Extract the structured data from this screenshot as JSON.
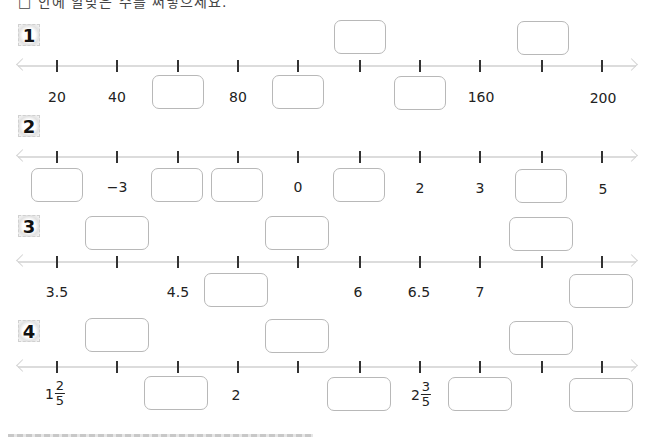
{
  "instruction": "□ 안에 알맞은 수를 써넣으세요.",
  "problems": [
    {
      "number": "1",
      "ticks": [
        "20",
        "40",
        "",
        "80",
        "",
        "",
        "",
        "160",
        "",
        "200"
      ],
      "answer_boxes_above": [
        6,
        9
      ],
      "answer_boxes_below": [
        3,
        5,
        7
      ],
      "labels_below": {
        "1": "20",
        "2": "40",
        "4": "80",
        "8": "160",
        "10": "200"
      }
    },
    {
      "number": "2",
      "ticks": [
        "",
        "-3",
        "",
        "",
        "0",
        "",
        "2",
        "3",
        "",
        "5"
      ],
      "answer_boxes_below": [
        1,
        3,
        4,
        6,
        9
      ],
      "labels_below": {
        "2": "−3",
        "5": "0",
        "7": "2",
        "8": "3",
        "10": "5"
      }
    },
    {
      "number": "3",
      "ticks": [
        "3.5",
        "",
        "4.5",
        "",
        "",
        "6",
        "6.5",
        "7",
        "",
        ""
      ],
      "answer_boxes_above": [
        2,
        5,
        9
      ],
      "answer_boxes_below": [
        4,
        10
      ],
      "labels_below": {
        "1": "3.5",
        "3": "4.5",
        "6": "6",
        "7": "6.5",
        "8": "7"
      }
    },
    {
      "number": "4",
      "ticks": [
        "1 2/5",
        "",
        "",
        "2",
        "",
        "",
        "2 3/5",
        "",
        "",
        ""
      ],
      "answer_boxes_above": [
        2,
        5,
        9
      ],
      "answer_boxes_below": [
        3,
        6,
        8,
        10
      ],
      "labels_below": {
        "1": {
          "whole": "1",
          "numerator": "2",
          "denominator": "5"
        },
        "4": "2",
        "7": {
          "whole": "2",
          "numerator": "3",
          "denominator": "5"
        }
      }
    }
  ],
  "labels": {
    "p1": {
      "t1": "20",
      "t2": "40",
      "t4": "80",
      "t8": "160",
      "t10": "200"
    },
    "p2": {
      "t2": "−3",
      "t5": "0",
      "t7": "2",
      "t8": "3",
      "t10": "5"
    },
    "p3": {
      "t1": "3.5",
      "t3": "4.5",
      "t6": "6",
      "t7": "6.5",
      "t8": "7"
    },
    "p4": {
      "t1_whole": "1",
      "t1_num": "2",
      "t1_den": "5",
      "t4": "2",
      "t7_whole": "2",
      "t7_num": "3",
      "t7_den": "5"
    }
  },
  "colors": {
    "axis": "#dcdcdc",
    "tick": "#333333",
    "box_border": "#b8b8b8",
    "text": "#222222"
  }
}
